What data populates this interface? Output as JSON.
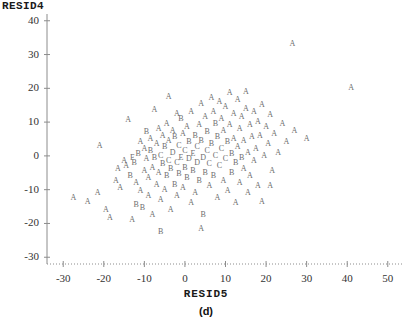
{
  "figure": {
    "panel_caption": "(d)",
    "axis_color": "#8c8c8c",
    "marker_color": "#6d6d6d",
    "text_color": "#1a1a1a"
  },
  "chart_data": {
    "type": "scatter",
    "title": "",
    "xlabel": "RESID5",
    "ylabel": "RESID4",
    "xlim": [
      -34,
      54
    ],
    "ylim": [
      -32,
      42
    ],
    "xticks": [
      -30,
      -20,
      -10,
      0,
      10,
      20,
      30,
      40,
      50
    ],
    "yticks": [
      -30,
      -20,
      -10,
      0,
      10,
      20,
      30,
      40
    ],
    "grid": false,
    "legend": null,
    "marker_style": "letter-codes",
    "marker_note": "Letters encode number of coincident observations: A=1, B=2, C=3, D=4, E=5, F=6",
    "points": [
      {
        "x": -27.5,
        "y": -12.5,
        "label": "A"
      },
      {
        "x": -24.0,
        "y": -13.5,
        "label": "A"
      },
      {
        "x": -21.5,
        "y": -11.0,
        "label": "A"
      },
      {
        "x": -21.0,
        "y": 3.0,
        "label": "A"
      },
      {
        "x": -19.5,
        "y": -16.0,
        "label": "A"
      },
      {
        "x": -17.0,
        "y": -7.5,
        "label": "A"
      },
      {
        "x": -16.5,
        "y": -4.0,
        "label": "A"
      },
      {
        "x": -16.0,
        "y": -9.5,
        "label": "A"
      },
      {
        "x": -15.0,
        "y": -1.5,
        "label": "A"
      },
      {
        "x": -14.5,
        "y": -3.0,
        "label": "A"
      },
      {
        "x": -14.0,
        "y": 10.5,
        "label": "A"
      },
      {
        "x": -13.5,
        "y": -6.0,
        "label": "B"
      },
      {
        "x": -13.0,
        "y": -0.5,
        "label": "F"
      },
      {
        "x": -12.5,
        "y": -2.0,
        "label": "B"
      },
      {
        "x": -12.0,
        "y": -8.0,
        "label": "A"
      },
      {
        "x": -12.0,
        "y": -14.5,
        "label": "B"
      },
      {
        "x": -11.5,
        "y": 0.5,
        "label": "B"
      },
      {
        "x": -11.0,
        "y": -10.5,
        "label": "A"
      },
      {
        "x": -11.0,
        "y": 4.0,
        "label": "A"
      },
      {
        "x": -10.5,
        "y": -15.5,
        "label": "B"
      },
      {
        "x": -10.0,
        "y": 2.0,
        "label": "A"
      },
      {
        "x": -10.0,
        "y": -4.5,
        "label": "A"
      },
      {
        "x": -9.5,
        "y": 7.0,
        "label": "B"
      },
      {
        "x": -9.5,
        "y": -1.0,
        "label": "A"
      },
      {
        "x": -9.0,
        "y": -6.5,
        "label": "A"
      },
      {
        "x": -9.0,
        "y": -12.0,
        "label": "A"
      },
      {
        "x": -8.5,
        "y": 1.5,
        "label": "B"
      },
      {
        "x": -8.5,
        "y": 5.0,
        "label": "A"
      },
      {
        "x": -8.0,
        "y": -3.5,
        "label": "A"
      },
      {
        "x": -8.0,
        "y": -17.5,
        "label": "A"
      },
      {
        "x": -7.5,
        "y": 13.5,
        "label": "A"
      },
      {
        "x": -7.5,
        "y": -0.5,
        "label": "B"
      },
      {
        "x": -7.0,
        "y": 3.5,
        "label": "A"
      },
      {
        "x": -7.0,
        "y": -8.5,
        "label": "A"
      },
      {
        "x": -6.5,
        "y": -5.0,
        "label": "A"
      },
      {
        "x": -6.5,
        "y": 8.0,
        "label": "A"
      },
      {
        "x": -6.0,
        "y": 0.0,
        "label": "C"
      },
      {
        "x": -6.0,
        "y": -13.0,
        "label": "A"
      },
      {
        "x": -5.5,
        "y": 6.0,
        "label": "A"
      },
      {
        "x": -5.5,
        "y": -2.5,
        "label": "B"
      },
      {
        "x": -5.0,
        "y": 2.5,
        "label": "B"
      },
      {
        "x": -5.0,
        "y": -10.0,
        "label": "A"
      },
      {
        "x": -4.5,
        "y": -6.0,
        "label": "B"
      },
      {
        "x": -4.5,
        "y": 9.5,
        "label": "A"
      },
      {
        "x": -4.0,
        "y": 4.5,
        "label": "A"
      },
      {
        "x": -4.0,
        "y": -1.5,
        "label": "C"
      },
      {
        "x": -3.5,
        "y": -4.0,
        "label": "B"
      },
      {
        "x": -3.5,
        "y": -16.0,
        "label": "A"
      },
      {
        "x": -3.0,
        "y": 1.0,
        "label": "D"
      },
      {
        "x": -3.0,
        "y": 7.5,
        "label": "A"
      },
      {
        "x": -2.5,
        "y": -8.5,
        "label": "B"
      },
      {
        "x": -2.5,
        "y": 5.5,
        "label": "B"
      },
      {
        "x": -2.0,
        "y": -2.0,
        "label": "C"
      },
      {
        "x": -2.0,
        "y": -12.0,
        "label": "A"
      },
      {
        "x": -1.5,
        "y": 3.0,
        "label": "C"
      },
      {
        "x": -1.5,
        "y": -5.5,
        "label": "B"
      },
      {
        "x": -1.0,
        "y": 11.0,
        "label": "B"
      },
      {
        "x": -1.0,
        "y": -0.5,
        "label": "E"
      },
      {
        "x": -0.5,
        "y": 6.5,
        "label": "A"
      },
      {
        "x": -0.5,
        "y": -9.5,
        "label": "A"
      },
      {
        "x": 0.0,
        "y": 1.5,
        "label": "C"
      },
      {
        "x": 0.0,
        "y": -3.5,
        "label": "B"
      },
      {
        "x": 0.5,
        "y": 8.5,
        "label": "A"
      },
      {
        "x": 0.5,
        "y": -6.5,
        "label": "B"
      },
      {
        "x": 1.0,
        "y": 4.0,
        "label": "B"
      },
      {
        "x": 1.0,
        "y": -1.0,
        "label": "D"
      },
      {
        "x": 1.5,
        "y": -14.0,
        "label": "A"
      },
      {
        "x": 1.5,
        "y": 13.0,
        "label": "A"
      },
      {
        "x": 2.0,
        "y": 0.5,
        "label": "E"
      },
      {
        "x": 2.0,
        "y": -4.5,
        "label": "B"
      },
      {
        "x": 2.5,
        "y": 6.0,
        "label": "B"
      },
      {
        "x": 2.5,
        "y": -11.0,
        "label": "A"
      },
      {
        "x": 3.0,
        "y": 2.5,
        "label": "C"
      },
      {
        "x": 3.0,
        "y": -2.0,
        "label": "D"
      },
      {
        "x": 3.5,
        "y": 9.0,
        "label": "A"
      },
      {
        "x": 3.5,
        "y": -7.5,
        "label": "B"
      },
      {
        "x": 4.0,
        "y": 15.5,
        "label": "A"
      },
      {
        "x": 4.0,
        "y": 4.5,
        "label": "B"
      },
      {
        "x": 4.5,
        "y": -0.5,
        "label": "D"
      },
      {
        "x": 4.5,
        "y": -17.5,
        "label": "B"
      },
      {
        "x": 5.0,
        "y": 11.5,
        "label": "A"
      },
      {
        "x": 5.0,
        "y": -5.0,
        "label": "B"
      },
      {
        "x": 5.5,
        "y": 1.5,
        "label": "C"
      },
      {
        "x": 5.5,
        "y": 7.0,
        "label": "B"
      },
      {
        "x": 6.0,
        "y": -9.0,
        "label": "A"
      },
      {
        "x": 6.0,
        "y": -2.5,
        "label": "C"
      },
      {
        "x": 6.5,
        "y": 17.0,
        "label": "A"
      },
      {
        "x": 6.5,
        "y": 3.5,
        "label": "B"
      },
      {
        "x": 7.0,
        "y": 13.0,
        "label": "A"
      },
      {
        "x": 7.0,
        "y": -6.0,
        "label": "B"
      },
      {
        "x": 7.5,
        "y": 0.0,
        "label": "C"
      },
      {
        "x": 7.5,
        "y": 9.5,
        "label": "B"
      },
      {
        "x": 8.0,
        "y": 5.5,
        "label": "B"
      },
      {
        "x": 8.0,
        "y": -12.5,
        "label": "A"
      },
      {
        "x": 8.5,
        "y": 16.0,
        "label": "A"
      },
      {
        "x": 8.5,
        "y": -3.0,
        "label": "C"
      },
      {
        "x": 9.0,
        "y": 2.0,
        "label": "C"
      },
      {
        "x": 9.0,
        "y": 11.0,
        "label": "A"
      },
      {
        "x": 9.5,
        "y": -7.5,
        "label": "A"
      },
      {
        "x": 9.5,
        "y": 7.5,
        "label": "A"
      },
      {
        "x": 10.0,
        "y": 14.5,
        "label": "A"
      },
      {
        "x": 10.0,
        "y": -1.0,
        "label": "C"
      },
      {
        "x": 10.5,
        "y": 4.0,
        "label": "B"
      },
      {
        "x": 10.5,
        "y": -10.5,
        "label": "A"
      },
      {
        "x": 11.0,
        "y": 18.5,
        "label": "A"
      },
      {
        "x": 11.0,
        "y": 9.0,
        "label": "A"
      },
      {
        "x": 11.5,
        "y": 0.5,
        "label": "B"
      },
      {
        "x": 11.5,
        "y": -5.0,
        "label": "B"
      },
      {
        "x": 12.0,
        "y": 12.5,
        "label": "A"
      },
      {
        "x": 12.0,
        "y": 5.0,
        "label": "A"
      },
      {
        "x": 12.5,
        "y": -2.0,
        "label": "B"
      },
      {
        "x": 12.5,
        "y": -14.0,
        "label": "A"
      },
      {
        "x": 13.0,
        "y": 16.5,
        "label": "A"
      },
      {
        "x": 13.0,
        "y": 2.5,
        "label": "A"
      },
      {
        "x": 13.5,
        "y": 8.0,
        "label": "A"
      },
      {
        "x": 13.5,
        "y": -8.0,
        "label": "A"
      },
      {
        "x": 14.0,
        "y": 11.5,
        "label": "A"
      },
      {
        "x": 14.0,
        "y": -0.5,
        "label": "B"
      },
      {
        "x": 14.5,
        "y": 4.5,
        "label": "A"
      },
      {
        "x": 14.5,
        "y": -4.0,
        "label": "A"
      },
      {
        "x": 15.0,
        "y": 19.0,
        "label": "A"
      },
      {
        "x": 15.0,
        "y": 14.0,
        "label": "A"
      },
      {
        "x": 15.5,
        "y": 1.0,
        "label": "A"
      },
      {
        "x": 15.5,
        "y": -11.0,
        "label": "A"
      },
      {
        "x": 16.0,
        "y": 9.0,
        "label": "A"
      },
      {
        "x": 16.0,
        "y": -6.0,
        "label": "A"
      },
      {
        "x": 16.5,
        "y": 5.5,
        "label": "A"
      },
      {
        "x": 17.0,
        "y": 13.0,
        "label": "A"
      },
      {
        "x": 17.0,
        "y": -1.5,
        "label": "A"
      },
      {
        "x": 17.5,
        "y": 2.0,
        "label": "A"
      },
      {
        "x": 18.0,
        "y": 10.0,
        "label": "A"
      },
      {
        "x": 18.0,
        "y": -9.0,
        "label": "A"
      },
      {
        "x": 18.5,
        "y": 6.0,
        "label": "A"
      },
      {
        "x": 19.0,
        "y": 15.0,
        "label": "A"
      },
      {
        "x": 19.5,
        "y": 0.0,
        "label": "A"
      },
      {
        "x": 20.0,
        "y": 8.5,
        "label": "A"
      },
      {
        "x": 20.5,
        "y": 3.5,
        "label": "A"
      },
      {
        "x": 21.0,
        "y": 12.0,
        "label": "A"
      },
      {
        "x": 21.5,
        "y": -4.5,
        "label": "A"
      },
      {
        "x": 22.0,
        "y": 6.5,
        "label": "A"
      },
      {
        "x": 23.0,
        "y": 1.0,
        "label": "A"
      },
      {
        "x": 24.0,
        "y": 9.5,
        "label": "A"
      },
      {
        "x": 25.0,
        "y": 4.0,
        "label": "A"
      },
      {
        "x": 26.5,
        "y": 33.0,
        "label": "A"
      },
      {
        "x": 27.0,
        "y": 7.5,
        "label": "A"
      },
      {
        "x": 30.0,
        "y": 5.0,
        "label": "A"
      },
      {
        "x": 41.0,
        "y": 20.0,
        "label": "A"
      },
      {
        "x": -6.0,
        "y": -22.5,
        "label": "B"
      },
      {
        "x": 4.0,
        "y": -21.5,
        "label": "A"
      },
      {
        "x": -13.0,
        "y": -19.0,
        "label": "A"
      },
      {
        "x": -18.5,
        "y": -18.5,
        "label": "A"
      },
      {
        "x": 19.0,
        "y": -13.5,
        "label": "A"
      },
      {
        "x": 21.0,
        "y": -9.0,
        "label": "A"
      },
      {
        "x": -2.0,
        "y": 12.5,
        "label": "A"
      },
      {
        "x": -4.0,
        "y": 17.5,
        "label": "A"
      }
    ]
  },
  "axis_labels": {
    "y_title": "RESID4",
    "x_title": "RESID5"
  }
}
